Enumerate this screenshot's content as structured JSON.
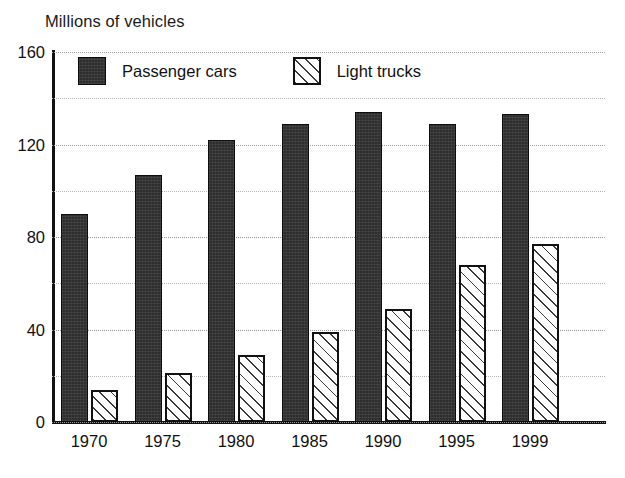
{
  "chart_data": {
    "type": "bar",
    "title": "Millions of vehicles",
    "xlabel": "",
    "ylabel": "",
    "ylim": [
      0,
      160
    ],
    "yticks": [
      0,
      40,
      80,
      120,
      160
    ],
    "yticks_minor": [
      20,
      60,
      100,
      140
    ],
    "grid": true,
    "legend_position": "top-left-inside",
    "categories": [
      "1970",
      "1975",
      "1980",
      "1985",
      "1990",
      "1995",
      "1999"
    ],
    "series": [
      {
        "name": "Passenger cars",
        "swatch": "solid-dark",
        "color": "#2e2e2e",
        "values": [
          90,
          107,
          122,
          129,
          134,
          129,
          133
        ]
      },
      {
        "name": "Light trucks",
        "swatch": "diagonal-hatch",
        "color": "#fdfdfd",
        "values": [
          14,
          21,
          29,
          39,
          49,
          68,
          77
        ]
      }
    ]
  },
  "axis": {
    "y_tick_labels": [
      "0",
      "40",
      "80",
      "120",
      "160"
    ],
    "x_tick_labels": [
      "1970",
      "1975",
      "1980",
      "1985",
      "1990",
      "1995",
      "1999"
    ]
  },
  "legend": {
    "entries": [
      {
        "label": "Passenger cars"
      },
      {
        "label": "Light trucks"
      }
    ]
  },
  "colors": {
    "passenger_cars": "#2e2e2e",
    "light_trucks": "#fdfdfd",
    "axis": "#111111",
    "gridline": "#9a9a9a",
    "background": "#ffffff"
  }
}
